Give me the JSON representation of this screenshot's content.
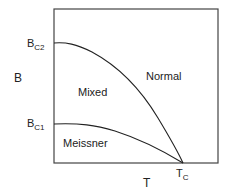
{
  "diagram": {
    "axes": {
      "x_label": "T",
      "y_label": "B",
      "x_tick": {
        "main": "T",
        "sub": "C"
      },
      "y_ticks": [
        {
          "main": "B",
          "sub": "C2"
        },
        {
          "main": "B",
          "sub": "C1"
        }
      ]
    },
    "regions": {
      "normal": "Normal",
      "mixed": "Mixed",
      "meissner": "Meissner"
    },
    "curves": [
      {
        "name": "Bc2(T)",
        "from": "B_C2",
        "to": "T_C"
      },
      {
        "name": "Bc1(T)",
        "from": "B_C1",
        "to": "T_C"
      }
    ],
    "colors": {
      "line": "#222222",
      "frame": "#444444",
      "background": "#ffffff"
    }
  }
}
